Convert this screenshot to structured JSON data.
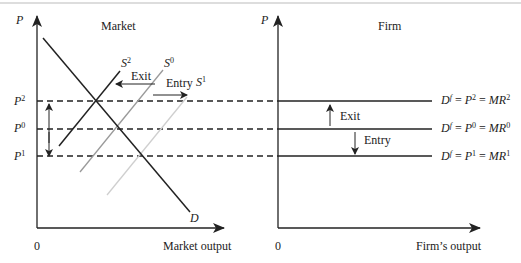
{
  "market_panel": {
    "title": "Market",
    "y_axis_label": "P",
    "x_axis_label": "Market output",
    "origin_label": "0",
    "price_levels": [
      {
        "name": "P",
        "sup": "2"
      },
      {
        "name": "P",
        "sup": "0"
      },
      {
        "name": "P",
        "sup": "1"
      }
    ],
    "curves": {
      "demand": "D",
      "supply_exit": {
        "name": "S",
        "sup": "2"
      },
      "supply_initial": {
        "name": "S",
        "sup": "0"
      },
      "supply_entry": {
        "name": "S",
        "sup": "1"
      }
    },
    "arrows": {
      "exit": "Exit",
      "entry": "Entry"
    }
  },
  "firm_panel": {
    "title": "Firm",
    "y_axis_label": "P",
    "x_axis_label": "Firm’s output",
    "origin_label": "0",
    "demand_lines": [
      {
        "lhs": "D",
        "lhs_sup": "f",
        "mid": "P",
        "mid_sup": "2",
        "rhs": "MR",
        "rhs_sup": "2"
      },
      {
        "lhs": "D",
        "lhs_sup": "f",
        "mid": "P",
        "mid_sup": "0",
        "rhs": "MR",
        "rhs_sup": "0"
      },
      {
        "lhs": "D",
        "lhs_sup": "f",
        "mid": "P",
        "mid_sup": "1",
        "rhs": "MR",
        "rhs_sup": "1"
      }
    ],
    "arrows": {
      "exit": "Exit",
      "entry": "Entry"
    }
  },
  "colors": {
    "axis": "#222222",
    "supply_exit": "#222222",
    "supply_initial": "#9a9a9a",
    "supply_entry": "#cfcfcf",
    "demand": "#222222"
  }
}
